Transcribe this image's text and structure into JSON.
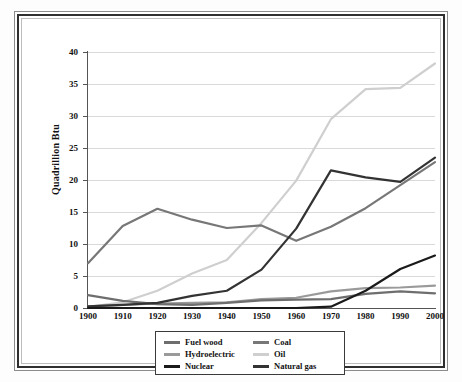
{
  "chart_data": {
    "type": "line",
    "title": "",
    "subtitle": "",
    "xlabel": "",
    "ylabel": "Quadrillion Btu",
    "x": [
      1900,
      1910,
      1920,
      1930,
      1940,
      1950,
      1960,
      1970,
      1980,
      1990,
      2000
    ],
    "xtick_labels": [
      "1900",
      "1910",
      "1920",
      "1930",
      "1940",
      "1950",
      "1960",
      "1970",
      "1980",
      "1990",
      "2000"
    ],
    "ytick_labels": [
      "0",
      "5",
      "10",
      "15",
      "20",
      "25",
      "30",
      "35",
      "40"
    ],
    "ytick_values": [
      0,
      5,
      10,
      15,
      20,
      25,
      30,
      35,
      40
    ],
    "xlim": [
      1900,
      2000
    ],
    "ylim": [
      0,
      40
    ],
    "grid": "horizontal",
    "legend_position": "below-plot",
    "series": [
      {
        "name": "Fuel wood",
        "color": "#6e6e6e",
        "values": [
          2.0,
          1.1,
          0.6,
          0.5,
          0.8,
          1.2,
          1.3,
          1.4,
          2.2,
          2.6,
          2.3
        ]
      },
      {
        "name": "Hydroelectric",
        "color": "#9a9a9a",
        "values": [
          0.25,
          0.5,
          0.7,
          0.8,
          0.9,
          1.4,
          1.6,
          2.6,
          3.1,
          3.2,
          3.5
        ]
      },
      {
        "name": "Nuclear",
        "color": "#1a1a1a",
        "values": [
          0,
          0,
          0,
          0,
          0,
          0,
          0,
          0.2,
          2.7,
          6.1,
          8.2
        ]
      },
      {
        "name": "Coal",
        "color": "#777777",
        "values": [
          7.0,
          12.8,
          15.5,
          13.8,
          12.5,
          12.9,
          10.5,
          12.7,
          15.6,
          19.2,
          22.8
        ]
      },
      {
        "name": "Oil",
        "color": "#cfcfcf",
        "values": [
          0.2,
          0.9,
          2.7,
          5.4,
          7.5,
          13.3,
          19.9,
          29.5,
          34.2,
          34.4,
          38.2
        ]
      },
      {
        "name": "Natural gas",
        "color": "#333333",
        "values": [
          0.25,
          0.5,
          0.8,
          1.9,
          2.7,
          6.0,
          12.4,
          21.5,
          20.4,
          19.7,
          23.5
        ]
      }
    ]
  },
  "legend": {
    "entries": [
      {
        "label": "Fuel wood",
        "color": "#6e6e6e"
      },
      {
        "label": "Coal",
        "color": "#777777"
      },
      {
        "label": "Hydroelectric",
        "color": "#9a9a9a"
      },
      {
        "label": "Oil",
        "color": "#cfcfcf"
      },
      {
        "label": "Nuclear",
        "color": "#1a1a1a"
      },
      {
        "label": "Natural gas",
        "color": "#333333"
      }
    ]
  }
}
